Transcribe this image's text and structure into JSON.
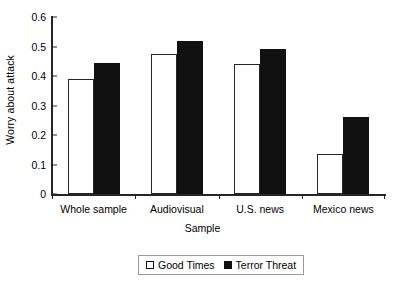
{
  "chart_data": {
    "type": "bar",
    "title": "",
    "xlabel": "Sample",
    "ylabel": "Worry about attack",
    "categories": [
      "Whole sample",
      "Audiovisual",
      "U.S. news",
      "Mexico news"
    ],
    "series": [
      {
        "name": "Good Times",
        "color": "#ffffff",
        "values": [
          0.39,
          0.475,
          0.44,
          0.135
        ]
      },
      {
        "name": "Terror Threat",
        "color": "#111111",
        "values": [
          0.445,
          0.52,
          0.49,
          0.26
        ]
      }
    ],
    "ylim": [
      0,
      0.6
    ],
    "yticks": [
      0,
      0.1,
      0.2,
      0.3,
      0.4,
      0.5,
      0.6
    ],
    "ytick_labels": [
      "0",
      "0.1",
      "0.2",
      "0.3",
      "0.4",
      "0.5",
      "0.6"
    ],
    "grid": false,
    "legend_position": "bottom-center"
  },
  "axes": {
    "y_title": "Worry about attack",
    "x_title": "Sample"
  },
  "legend": {
    "items": [
      {
        "label": "Good Times",
        "swatch": "open-square-icon"
      },
      {
        "label": "Terror Threat",
        "swatch": "filled-square-icon"
      }
    ]
  }
}
